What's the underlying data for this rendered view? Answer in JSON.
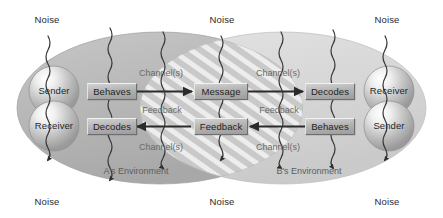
{
  "diagram": {
    "type": "communication-model-diagram",
    "colors": {
      "env_a_fill": "#b8b8b8",
      "env_b_fill": "#d8d8d8",
      "overlap_stripe_light": "#e6e6e6",
      "overlap_stripe_dark": "#bdbdbd",
      "box_fill": "#b4b4b4",
      "box_border": "#6e6e6e",
      "arrow": "#2b2b2b",
      "noise_line": "#3a3a3a",
      "text_dark": "#1f1f1f",
      "text_muted": "#6a6a6a"
    },
    "environments": [
      {
        "id": "a",
        "label": "A's Environment"
      },
      {
        "id": "b",
        "label": "B's Environment"
      }
    ],
    "participants": {
      "left": [
        {
          "role": "Sender",
          "action": "Behaves"
        },
        {
          "role": "Receiver",
          "action": "Decodes"
        }
      ],
      "right": [
        {
          "role": "Receiver",
          "action": "Decodes"
        },
        {
          "role": "Sender",
          "action": "Behaves"
        }
      ]
    },
    "center_nodes": [
      {
        "id": "message",
        "label": "Message"
      },
      {
        "id": "feedback",
        "label": "Feedback"
      }
    ],
    "channel_labels": [
      {
        "id": "chan-top-left",
        "label": "Channel(s)"
      },
      {
        "id": "chan-top-right",
        "label": "Channel(s)"
      },
      {
        "id": "chan-bottom-left",
        "label": "Channel(s)"
      },
      {
        "id": "chan-bottom-right",
        "label": "Channel(s)"
      }
    ],
    "feedback_labels": [
      {
        "id": "fb-left",
        "label": "Feedback"
      },
      {
        "id": "fb-right",
        "label": "Feedback"
      }
    ],
    "noise_labels_top": [
      {
        "id": "noise-top-left",
        "label": "Noise"
      },
      {
        "id": "noise-top-center",
        "label": "Noise"
      },
      {
        "id": "noise-top-right",
        "label": "Noise"
      }
    ],
    "noise_labels_bottom": [
      {
        "id": "noise-bottom-left",
        "label": "Noise"
      },
      {
        "id": "noise-bottom-center",
        "label": "Noise"
      },
      {
        "id": "noise-bottom-right",
        "label": "Noise"
      }
    ],
    "noise_line_count": 7,
    "flow": {
      "forward": "Sender A behaves, message travels through channel(s) to Receiver B who decodes",
      "reverse": "Sender B behaves, feedback travels through channel(s) to Receiver A who decodes"
    }
  }
}
